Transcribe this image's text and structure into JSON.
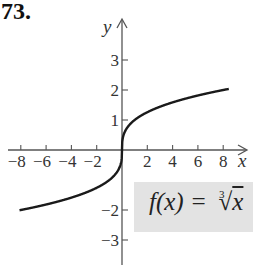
{
  "problem_number": "73.",
  "function_label": {
    "lhs": "f(x) = ",
    "root_index": "3",
    "radical": "√",
    "radicand": "x"
  },
  "colors": {
    "curve": "#1a1a1a",
    "axis": "#555555",
    "label_box": "#e3e3e3"
  },
  "chart_data": {
    "type": "line",
    "xlabel": "x",
    "ylabel": "y",
    "xlim": [
      -9,
      9.5
    ],
    "ylim": [
      -3.8,
      4.2
    ],
    "x_ticks": [
      -8,
      -6,
      -4,
      -2,
      2,
      4,
      6,
      8
    ],
    "x_tick_labels": [
      "−8",
      "−6",
      "−4",
      "−2",
      "2",
      "4",
      "6",
      "8"
    ],
    "y_ticks": [
      -3,
      -2,
      1,
      2,
      3
    ],
    "y_tick_labels": [
      "−3",
      "−2",
      "1",
      "2",
      "3"
    ],
    "grid": false,
    "legend": "none",
    "series": [
      {
        "name": "f(x) = ∛x",
        "x": [
          -9,
          -8,
          -6,
          -4,
          -2,
          -1,
          -0.5,
          -0.125,
          0,
          0.125,
          0.5,
          1,
          2,
          4,
          6,
          8,
          9
        ],
        "values": [
          -2.08,
          -2,
          -1.82,
          -1.59,
          -1.26,
          -1,
          -0.79,
          -0.5,
          0,
          0.5,
          0.79,
          1,
          1.26,
          1.59,
          1.82,
          2,
          2.08
        ]
      }
    ]
  }
}
